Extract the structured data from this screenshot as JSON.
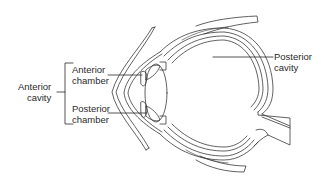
{
  "figure": {
    "labels": {
      "anterior_cavity": {
        "line1": "Anterior",
        "line2": "cavity"
      },
      "anterior_chamber": {
        "line1": "Anterior",
        "line2": "chamber"
      },
      "posterior_chamber": {
        "line1": "Posterior",
        "line2": "chamber"
      },
      "posterior_cavity": {
        "line1": "Posterior",
        "line2": "cavity"
      }
    },
    "colors": {
      "line": "#3a3a3a",
      "text": "#2a2a2a",
      "background": "#ffffff"
    }
  }
}
